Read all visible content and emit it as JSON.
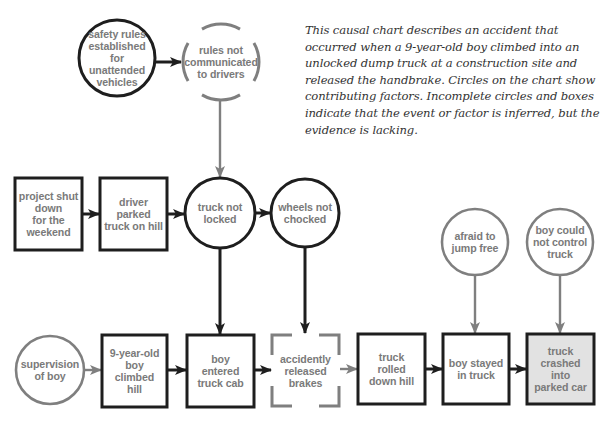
{
  "caption": "This causal chart describes an accident that occurred when a 9-year-old boy climbed into an unlocked dump truck at a construction site and released the handbrake. Circles on the chart show contributing factors. Incomplete circles and boxes indicate that the event or factor is inferred, but the evidence is lacking.",
  "colors": {
    "dark_stroke": "#1e1e1e",
    "gray_stroke": "#7f7f7f",
    "label_text": "#7a7a7a",
    "final_fill": "#e2e2e2"
  },
  "nodes": [
    {
      "id": "safety-rules",
      "shape": "circle",
      "style": "dark",
      "label": "safety rules\nestablished\nfor unattended\nvehicles",
      "cx": 117,
      "cy": 58,
      "r": 38
    },
    {
      "id": "rules-not-communicated",
      "shape": "circle",
      "style": "gray-dashed",
      "label": "rules not\ncommunicated\nto drivers",
      "cx": 221,
      "cy": 62,
      "r": 38
    },
    {
      "id": "project-shut-down",
      "shape": "box",
      "style": "dark",
      "label": "project shut\ndown\nfor the\nweekend",
      "x": 15,
      "y": 178,
      "w": 67,
      "h": 72
    },
    {
      "id": "driver-parked",
      "shape": "box",
      "style": "dark",
      "label": "driver\nparked\ntruck on hill",
      "x": 100,
      "y": 178,
      "w": 67,
      "h": 72
    },
    {
      "id": "truck-not-locked",
      "shape": "circle",
      "style": "dark",
      "label": "truck not\nlocked",
      "cx": 220,
      "cy": 213,
      "r": 35
    },
    {
      "id": "wheels-not-chocked",
      "shape": "circle",
      "style": "dark",
      "label": "wheels not\nchocked",
      "cx": 305,
      "cy": 213,
      "r": 34
    },
    {
      "id": "afraid-to-jump",
      "shape": "circle",
      "style": "gray",
      "label": "afraid to\njump free",
      "cx": 475,
      "cy": 242,
      "r": 33
    },
    {
      "id": "boy-could-not-control",
      "shape": "circle",
      "style": "gray",
      "label": "boy could\nnot control\ntruck",
      "cx": 560,
      "cy": 242,
      "r": 33
    },
    {
      "id": "supervision-of-boy",
      "shape": "circle",
      "style": "gray",
      "label": "supervision\nof boy",
      "cx": 50,
      "cy": 370,
      "r": 34
    },
    {
      "id": "boy-climbed-hill",
      "shape": "box",
      "style": "dark",
      "label": "9-year-old\nboy\nclimbed\nhill",
      "x": 102,
      "y": 335,
      "w": 65,
      "h": 72
    },
    {
      "id": "boy-entered-cab",
      "shape": "box",
      "style": "dark",
      "label": "boy\nentered\ntruck cab",
      "x": 187,
      "y": 335,
      "w": 67,
      "h": 72
    },
    {
      "id": "accidently-released-brakes",
      "shape": "box",
      "style": "gray-dashed",
      "label": "accidently\nreleased\nbrakes",
      "x": 272,
      "y": 335,
      "w": 67,
      "h": 71
    },
    {
      "id": "truck-rolled",
      "shape": "box",
      "style": "dark",
      "label": "truck\nrolled\ndown hill",
      "x": 358,
      "y": 334,
      "w": 67,
      "h": 70
    },
    {
      "id": "boy-stayed",
      "shape": "box",
      "style": "dark",
      "label": "boy stayed\nin truck",
      "x": 443,
      "y": 334,
      "w": 66,
      "h": 70
    },
    {
      "id": "truck-crashed",
      "shape": "box",
      "style": "final",
      "label": "truck\ncrashed\ninto\nparked car",
      "x": 527,
      "y": 334,
      "w": 67,
      "h": 70
    }
  ],
  "edges": [
    {
      "from": "safety-rules",
      "to": "rules-not-communicated",
      "style": "dark",
      "x1": 155,
      "y1": 62,
      "x2": 181,
      "y2": 62
    },
    {
      "from": "rules-not-communicated",
      "to": "truck-not-locked",
      "style": "gray",
      "x1": 220,
      "y1": 101,
      "x2": 220,
      "y2": 177
    },
    {
      "from": "project-shut-down",
      "to": "driver-parked",
      "style": "dark",
      "x1": 82,
      "y1": 214,
      "x2": 99,
      "y2": 214
    },
    {
      "from": "driver-parked",
      "to": "truck-not-locked",
      "style": "dark",
      "x1": 167,
      "y1": 214,
      "x2": 184,
      "y2": 214
    },
    {
      "from": "truck-not-locked",
      "to": "wheels-not-chocked",
      "style": "dark",
      "x1": 255,
      "y1": 213,
      "x2": 270,
      "y2": 213
    },
    {
      "from": "truck-not-locked",
      "to": "boy-entered-cab",
      "style": "dark",
      "x1": 220,
      "y1": 248,
      "x2": 220,
      "y2": 334
    },
    {
      "from": "wheels-not-chocked",
      "to": "accidently-released-brakes",
      "style": "dark",
      "x1": 305,
      "y1": 247,
      "x2": 305,
      "y2": 333
    },
    {
      "from": "supervision-of-boy",
      "to": "boy-climbed-hill",
      "style": "gray",
      "x1": 84,
      "y1": 370,
      "x2": 101,
      "y2": 370
    },
    {
      "from": "boy-climbed-hill",
      "to": "boy-entered-cab",
      "style": "dark",
      "x1": 167,
      "y1": 370,
      "x2": 186,
      "y2": 370
    },
    {
      "from": "boy-entered-cab",
      "to": "accidently-released-brakes",
      "style": "dark",
      "x1": 254,
      "y1": 370,
      "x2": 271,
      "y2": 370
    },
    {
      "from": "accidently-released-brakes",
      "to": "truck-rolled",
      "style": "gray",
      "x1": 340,
      "y1": 369,
      "x2": 357,
      "y2": 369
    },
    {
      "from": "truck-rolled",
      "to": "boy-stayed",
      "style": "dark",
      "x1": 425,
      "y1": 369,
      "x2": 442,
      "y2": 369
    },
    {
      "from": "boy-stayed",
      "to": "truck-crashed",
      "style": "dark",
      "x1": 509,
      "y1": 369,
      "x2": 526,
      "y2": 369
    },
    {
      "from": "afraid-to-jump",
      "to": "boy-stayed",
      "style": "gray",
      "x1": 475,
      "y1": 275,
      "x2": 475,
      "y2": 333
    },
    {
      "from": "boy-could-not-control",
      "to": "truck-crashed",
      "style": "gray",
      "x1": 560,
      "y1": 275,
      "x2": 560,
      "y2": 333
    }
  ]
}
